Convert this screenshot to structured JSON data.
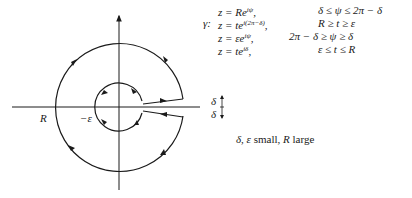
{
  "diagram": {
    "labels": {
      "R": "R",
      "neg_eps": "−ε",
      "delta_top": "δ",
      "delta_bottom": "δ",
      "gamma": "γ:"
    },
    "geometry": {
      "center": [
        119,
        107
      ],
      "outer_radius": 64,
      "inner_radius": 24,
      "gap_upper_y": 99,
      "gap_lower_y": 116,
      "axis_color": "#1a1a1a",
      "curve_color": "#1a1a1a"
    }
  },
  "equations": {
    "left": [
      {
        "lhs": "z = ",
        "base": "Re",
        "sup": "iψ",
        "tail": ","
      },
      {
        "lhs": "z = ",
        "base": "te",
        "sup": "i(2π−δ)",
        "tail": ","
      },
      {
        "lhs": "z = ",
        "base": "εe",
        "sup": "iψ",
        "tail": ","
      },
      {
        "lhs": "z = ",
        "base": "te",
        "sup": "iδ",
        "tail": ","
      }
    ],
    "right": [
      "δ ≤ ψ ≤ 2π − δ",
      "R ≥ t ≥ ε",
      "2π −  δ ≥ ψ ≥ δ",
      "ε ≤ t ≤ R"
    ]
  },
  "note": {
    "part1": "δ, ε",
    "part2": " small, ",
    "part3": "R",
    "part4": " large"
  }
}
